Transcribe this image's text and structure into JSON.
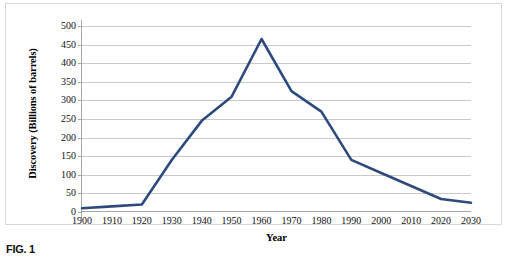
{
  "figure": {
    "caption": "FIG. 1"
  },
  "chart_data": {
    "type": "line",
    "title": "",
    "xlabel": "Year",
    "ylabel": "Discovery (Billions of barrels)",
    "x": [
      1900,
      1910,
      1920,
      1930,
      1940,
      1950,
      1960,
      1970,
      1980,
      1990,
      2000,
      2010,
      2020,
      2030
    ],
    "categories": [
      "1900",
      "1910",
      "1920",
      "1930",
      "1940",
      "1950",
      "1960",
      "1970",
      "1980",
      "1990",
      "2000",
      "2010",
      "2020",
      "2030"
    ],
    "values": [
      10,
      15,
      20,
      140,
      245,
      310,
      465,
      325,
      270,
      140,
      105,
      70,
      35,
      25
    ],
    "series": [
      {
        "name": "Discovery",
        "values": [
          10,
          15,
          20,
          140,
          245,
          310,
          465,
          325,
          270,
          140,
          105,
          70,
          35,
          25
        ],
        "color": "#2E4A7D"
      }
    ],
    "xlim": [
      1900,
      2030
    ],
    "ylim": [
      0,
      500
    ],
    "yticks": [
      0,
      50,
      100,
      150,
      200,
      250,
      300,
      350,
      400,
      450,
      500
    ],
    "ytick_labels": [
      "0",
      "50",
      "100",
      "150",
      "200",
      "250",
      "300",
      "350",
      "400",
      "450",
      "500"
    ],
    "grid": "horizontal",
    "legend": "none",
    "line_color": "#2E4A7D",
    "gridline_color": "#C9C9C9",
    "axis_color": "#A6A6A6",
    "background": "#FFFFFF"
  }
}
